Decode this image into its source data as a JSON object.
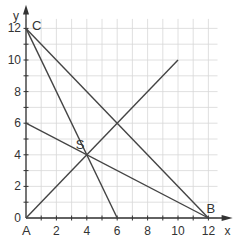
{
  "diagram": {
    "type": "coordinate-plane",
    "axes": {
      "x_label": "x",
      "y_label": "y",
      "x_ticks": [
        "0",
        "2",
        "4",
        "6",
        "8",
        "10",
        "12"
      ],
      "y_ticks": [
        "0",
        "2",
        "4",
        "6",
        "8",
        "10",
        "12"
      ],
      "x_range": [
        0,
        12.5
      ],
      "y_range": [
        0,
        12.5
      ],
      "grid": "1 unit"
    },
    "points": [
      {
        "name": "A",
        "x": 0,
        "y": 0
      },
      {
        "name": "B",
        "x": 12,
        "y": 0
      },
      {
        "name": "C",
        "x": 0,
        "y": 12
      },
      {
        "name": "S",
        "x": 4,
        "y": 4
      }
    ],
    "segments": [
      {
        "from": [
          0,
          12
        ],
        "to": [
          12,
          0
        ]
      },
      {
        "from": [
          0,
          12
        ],
        "to": [
          6,
          0
        ]
      },
      {
        "from": [
          0,
          6
        ],
        "to": [
          12,
          0
        ]
      },
      {
        "from": [
          0,
          0
        ],
        "to": [
          10,
          10
        ]
      }
    ],
    "colors": {
      "line": "#444444",
      "grid": "#d8d8d8",
      "axis": "#333333"
    }
  }
}
